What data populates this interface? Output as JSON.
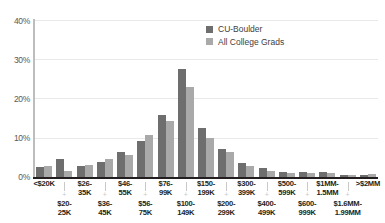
{
  "chart_data": {
    "type": "bar",
    "title": "",
    "subtitle": "",
    "xlabel": "",
    "ylabel": "",
    "ylim": [
      0,
      40
    ],
    "yticks": [
      0,
      10,
      20,
      30,
      40
    ],
    "ytick_labels": [
      "0%",
      "10%",
      "20%",
      "30%",
      "40%"
    ],
    "grid": true,
    "legend_position": "top-center",
    "categories": [
      "<$20K",
      "$20-\n25K",
      "$26-\n35K",
      "$36-\n45K",
      "$46-\n55K",
      "$56-\n75K",
      "$76-\n99K",
      "$100-\n149K",
      "$150-\n199K",
      "$200-\n299K",
      "$300-\n399K",
      "$400-\n499K",
      "$500-\n599K",
      "$600-\n999K",
      "$1MM-\n1.5MM",
      "$1.6MM-\n1.99MM",
      ">$2MM"
    ],
    "series": [
      {
        "name": "CU-Boulder",
        "color": "#6e6e6e",
        "values": [
          2.6,
          4.6,
          2.7,
          3.7,
          6.3,
          9.3,
          15.8,
          27.5,
          12.5,
          7.2,
          3.6,
          2.2,
          1.2,
          1.2,
          1.4,
          0.6,
          0.6
        ]
      },
      {
        "name": "All College Grads",
        "color": "#a9a9a9",
        "values": [
          2.7,
          1.5,
          3.1,
          4.5,
          5.6,
          10.7,
          14.3,
          23.0,
          10.0,
          6.4,
          2.9,
          1.5,
          1.1,
          1.0,
          0.9,
          0.5,
          0.8
        ]
      }
    ]
  },
  "legend": {
    "items": [
      {
        "label": "CU-Boulder",
        "color": "#6e6e6e"
      },
      {
        "label": "All College Grads",
        "color": "#a9a9a9"
      }
    ]
  },
  "axis": {
    "y": {
      "ticks": [
        "40%",
        "30%",
        "20%",
        "10%",
        "0%"
      ]
    },
    "x": {
      "top_labels": [
        "<$20K",
        "$26-\n35K",
        "$46-\n55K",
        "$76-\n99K",
        "$150-\n199K",
        "$300-\n399K",
        "$500-\n599K",
        "$1MM-\n1.5MM",
        ">$2MM"
      ],
      "bottom_labels": [
        "$20-\n25K",
        "$36-\n45K",
        "$56-\n75K",
        "$100-\n149K",
        "$200-\n299K",
        "$400-\n499K",
        "$600-\n999K",
        "$1.6MM-\n1.99MM"
      ],
      "separator": "+"
    }
  },
  "colors": {
    "series_primary": "#6e6e6e",
    "series_secondary": "#a9a9a9",
    "gridline": "#e9e9e9",
    "axis": "#231f20",
    "text": "#58595b"
  }
}
